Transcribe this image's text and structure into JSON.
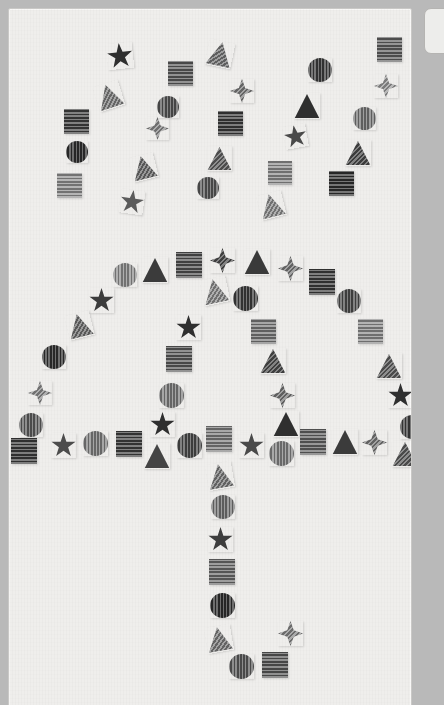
{
  "scene": {
    "title": "Textured shape mosaic forming an umbrella",
    "description": "Grayscale geometric shapes with striped textures arranged to outline an umbrella with falling rain above it",
    "background_color": "#efeeec",
    "panel_border_color": "#c9c8c6",
    "page_background": "#b9b9b9"
  },
  "side_panel": {
    "present": true,
    "background": "#ededeb",
    "border": "#b5b4b2"
  },
  "shape_legend": {
    "types": [
      "star",
      "star4",
      "square",
      "circle",
      "triangle"
    ],
    "textures": [
      "horizontal-stripes",
      "vertical-stripes",
      "diagonal-stripes",
      "solid"
    ],
    "gray_values": [
      "#2f2f2f",
      "#3c3c3c",
      "#4a4a4a",
      "#565656",
      "#646464",
      "#727272",
      "#818181",
      "#909090",
      "#a0a0a0"
    ]
  },
  "groups": {
    "rain": {
      "label": "falling rain shapes",
      "count": 24
    },
    "canopy": {
      "label": "umbrella canopy arc",
      "count": 29
    },
    "rim": {
      "label": "umbrella rim row",
      "count": 18
    },
    "handle": {
      "label": "umbrella handle shaft and hook",
      "count": 13
    }
  },
  "shapes": [
    {
      "g": "rain",
      "t": "st",
      "tex": "tex-n",
      "c": "#2f2f2f",
      "x": 106,
      "y": 42,
      "s": 26,
      "r": -6
    },
    {
      "g": "rain",
      "t": "tr",
      "tex": "tex-d",
      "c": "#7e7e7e",
      "x": 95,
      "y": 82,
      "s": 26,
      "r": -18
    },
    {
      "g": "rain",
      "t": "sq",
      "tex": "tex-h",
      "c": "#3f3f3f",
      "x": 63,
      "y": 108,
      "s": 25,
      "r": 0
    },
    {
      "g": "rain",
      "t": "ci",
      "tex": "tex-v",
      "c": "#2f2f2f",
      "x": 65,
      "y": 140,
      "s": 22,
      "r": 0
    },
    {
      "g": "rain",
      "t": "sq",
      "tex": "tex-h",
      "c": "#8e8e8e",
      "x": 56,
      "y": 172,
      "s": 25,
      "r": 0
    },
    {
      "g": "rain",
      "t": "st",
      "tex": "tex-n",
      "c": "#5b5b5b",
      "x": 119,
      "y": 189,
      "s": 24,
      "r": 8
    },
    {
      "g": "rain",
      "t": "tr",
      "tex": "tex-d",
      "c": "#6d6d6d",
      "x": 130,
      "y": 154,
      "s": 25,
      "r": -14
    },
    {
      "g": "rain",
      "t": "st4",
      "tex": "tex-d",
      "c": "#8a8a8a",
      "x": 145,
      "y": 116,
      "s": 23,
      "r": 0
    },
    {
      "g": "rain",
      "t": "sq",
      "tex": "tex-h",
      "c": "#5a5a5a",
      "x": 167,
      "y": 60,
      "s": 25,
      "r": 0
    },
    {
      "g": "rain",
      "t": "ci",
      "tex": "tex-v",
      "c": "#565656",
      "x": 156,
      "y": 95,
      "s": 22,
      "r": 0
    },
    {
      "g": "rain",
      "t": "tr",
      "tex": "tex-d",
      "c": "#757575",
      "x": 206,
      "y": 40,
      "s": 26,
      "r": 12
    },
    {
      "g": "rain",
      "t": "st4",
      "tex": "tex-d",
      "c": "#7d7d7d",
      "x": 229,
      "y": 78,
      "s": 24,
      "r": 0
    },
    {
      "g": "rain",
      "t": "sq",
      "tex": "tex-h",
      "c": "#3a3a3a",
      "x": 217,
      "y": 110,
      "s": 25,
      "r": 0
    },
    {
      "g": "rain",
      "t": "tr",
      "tex": "tex-d",
      "c": "#5f5f5f",
      "x": 206,
      "y": 145,
      "s": 25,
      "r": 0
    },
    {
      "g": "rain",
      "t": "ci",
      "tex": "tex-v",
      "c": "#585858",
      "x": 196,
      "y": 176,
      "s": 22,
      "r": 0
    },
    {
      "g": "rain",
      "t": "tr",
      "tex": "tex-d",
      "c": "#8d8d8d",
      "x": 258,
      "y": 192,
      "s": 25,
      "r": -14
    },
    {
      "g": "rain",
      "t": "sq",
      "tex": "tex-h",
      "c": "#8b8b8b",
      "x": 267,
      "y": 160,
      "s": 24,
      "r": 0
    },
    {
      "g": "rain",
      "t": "st",
      "tex": "tex-n",
      "c": "#4a4a4a",
      "x": 283,
      "y": 124,
      "s": 23,
      "r": -10
    },
    {
      "g": "rain",
      "t": "tr",
      "tex": "tex-n",
      "c": "#2f2f2f",
      "x": 293,
      "y": 92,
      "s": 26,
      "r": 0
    },
    {
      "g": "rain",
      "t": "ci",
      "tex": "tex-v",
      "c": "#3d3d3d",
      "x": 307,
      "y": 57,
      "s": 24,
      "r": 0
    },
    {
      "g": "rain",
      "t": "sq",
      "tex": "tex-h",
      "c": "#2f2f2f",
      "x": 328,
      "y": 170,
      "s": 25,
      "r": 0
    },
    {
      "g": "rain",
      "t": "tr",
      "tex": "tex-d",
      "c": "#4b4b4b",
      "x": 344,
      "y": 139,
      "s": 26,
      "r": 0
    },
    {
      "g": "rain",
      "t": "ci",
      "tex": "tex-v",
      "c": "#757575",
      "x": 352,
      "y": 106,
      "s": 23,
      "r": 0
    },
    {
      "g": "rain",
      "t": "st4",
      "tex": "tex-d",
      "c": "#9a9a9a",
      "x": 373,
      "y": 73,
      "s": 24,
      "r": 0
    },
    {
      "g": "rain",
      "t": "sq",
      "tex": "tex-h",
      "c": "#5f5f5f",
      "x": 376,
      "y": 36,
      "s": 25,
      "r": 0
    },
    {
      "g": "canopy",
      "t": "tr",
      "tex": "tex-n",
      "c": "#3b3b3b",
      "x": 141,
      "y": 256,
      "s": 26,
      "r": 0
    },
    {
      "g": "canopy",
      "t": "sq",
      "tex": "tex-h",
      "c": "#4f4f4f",
      "x": 175,
      "y": 251,
      "s": 26,
      "r": 0
    },
    {
      "g": "canopy",
      "t": "st4",
      "tex": "tex-d",
      "c": "#4d4d4d",
      "x": 209,
      "y": 247,
      "s": 25,
      "r": 0
    },
    {
      "g": "canopy",
      "t": "tr",
      "tex": "tex-n",
      "c": "#3a3a3a",
      "x": 243,
      "y": 248,
      "s": 26,
      "r": 0
    },
    {
      "g": "canopy",
      "t": "st4",
      "tex": "tex-d",
      "c": "#7b7b7b",
      "x": 277,
      "y": 255,
      "s": 25,
      "r": 0
    },
    {
      "g": "canopy",
      "t": "sq",
      "tex": "tex-h",
      "c": "#3b3b3b",
      "x": 308,
      "y": 268,
      "s": 26,
      "r": 0
    },
    {
      "g": "canopy",
      "t": "ci",
      "tex": "tex-v",
      "c": "#4c4c4c",
      "x": 336,
      "y": 288,
      "s": 24,
      "r": 0
    },
    {
      "g": "canopy",
      "t": "sq",
      "tex": "tex-h",
      "c": "#8a8a8a",
      "x": 357,
      "y": 318,
      "s": 25,
      "r": 0
    },
    {
      "g": "canopy",
      "t": "tr",
      "tex": "tex-d",
      "c": "#5d5d5d",
      "x": 375,
      "y": 352,
      "s": 26,
      "r": 0
    },
    {
      "g": "canopy",
      "t": "st",
      "tex": "tex-n",
      "c": "#2f2f2f",
      "x": 387,
      "y": 382,
      "s": 25,
      "r": 0
    },
    {
      "g": "canopy",
      "t": "ci",
      "tex": "tex-v",
      "c": "#3e3e3e",
      "x": 399,
      "y": 414,
      "s": 24,
      "r": 0
    },
    {
      "g": "canopy",
      "t": "ci",
      "tex": "tex-v",
      "c": "#8d8d8d",
      "x": 112,
      "y": 262,
      "s": 24,
      "r": 0
    },
    {
      "g": "canopy",
      "t": "st",
      "tex": "tex-n",
      "c": "#3c3c3c",
      "x": 88,
      "y": 287,
      "s": 25,
      "r": 0
    },
    {
      "g": "canopy",
      "t": "tr",
      "tex": "tex-d",
      "c": "#6f6f6f",
      "x": 66,
      "y": 312,
      "s": 25,
      "r": -14
    },
    {
      "g": "canopy",
      "t": "ci",
      "tex": "tex-v",
      "c": "#313131",
      "x": 41,
      "y": 344,
      "s": 24,
      "r": 0
    },
    {
      "g": "canopy",
      "t": "st4",
      "tex": "tex-d",
      "c": "#8c8c8c",
      "x": 27,
      "y": 380,
      "s": 24,
      "r": 0
    },
    {
      "g": "canopy",
      "t": "ci",
      "tex": "tex-v",
      "c": "#5e5e5e",
      "x": 18,
      "y": 412,
      "s": 24,
      "r": 0
    },
    {
      "g": "canopy",
      "t": "tr",
      "tex": "tex-d",
      "c": "#8b8b8b",
      "x": 201,
      "y": 277,
      "s": 26,
      "r": -12
    },
    {
      "g": "canopy",
      "t": "ci",
      "tex": "tex-v",
      "c": "#3d3d3d",
      "x": 232,
      "y": 285,
      "s": 25,
      "r": 0
    },
    {
      "g": "canopy",
      "t": "st",
      "tex": "tex-n",
      "c": "#2f2f2f",
      "x": 175,
      "y": 314,
      "s": 25,
      "r": 0
    },
    {
      "g": "canopy",
      "t": "sq",
      "tex": "tex-h",
      "c": "#777777",
      "x": 250,
      "y": 318,
      "s": 25,
      "r": 0
    },
    {
      "g": "canopy",
      "t": "sq",
      "tex": "tex-h",
      "c": "#5a5a5a",
      "x": 165,
      "y": 345,
      "s": 26,
      "r": 0
    },
    {
      "g": "canopy",
      "t": "tr",
      "tex": "tex-d",
      "c": "#4d4d4d",
      "x": 259,
      "y": 347,
      "s": 26,
      "r": 0
    },
    {
      "g": "canopy",
      "t": "ci",
      "tex": "tex-v",
      "c": "#7e7e7e",
      "x": 158,
      "y": 382,
      "s": 25,
      "r": 0
    },
    {
      "g": "canopy",
      "t": "st4",
      "tex": "tex-d",
      "c": "#777777",
      "x": 269,
      "y": 382,
      "s": 25,
      "r": 0
    },
    {
      "g": "canopy",
      "t": "st",
      "tex": "tex-n",
      "c": "#2f2f2f",
      "x": 149,
      "y": 411,
      "s": 25,
      "r": 0
    },
    {
      "g": "canopy",
      "t": "tr",
      "tex": "tex-n",
      "c": "#2f2f2f",
      "x": 272,
      "y": 410,
      "s": 26,
      "r": 0
    },
    {
      "g": "rim",
      "t": "sq",
      "tex": "tex-h",
      "c": "#3a3a3a",
      "x": 10,
      "y": 437,
      "s": 26,
      "r": 0
    },
    {
      "g": "rim",
      "t": "st",
      "tex": "tex-n",
      "c": "#4c4c4c",
      "x": 50,
      "y": 432,
      "s": 25,
      "r": 0
    },
    {
      "g": "rim",
      "t": "ci",
      "tex": "tex-v",
      "c": "#7f7f7f",
      "x": 82,
      "y": 430,
      "s": 25,
      "r": 0
    },
    {
      "g": "rim",
      "t": "sq",
      "tex": "tex-h",
      "c": "#3f3f3f",
      "x": 115,
      "y": 430,
      "s": 26,
      "r": 0
    },
    {
      "g": "rim",
      "t": "tr",
      "tex": "tex-n",
      "c": "#444444",
      "x": 143,
      "y": 442,
      "s": 26,
      "r": 0
    },
    {
      "g": "rim",
      "t": "ci",
      "tex": "tex-v",
      "c": "#4b4b4b",
      "x": 176,
      "y": 432,
      "s": 25,
      "r": 0
    },
    {
      "g": "rim",
      "t": "sq",
      "tex": "tex-h",
      "c": "#7c7c7c",
      "x": 205,
      "y": 425,
      "s": 26,
      "r": 0
    },
    {
      "g": "rim",
      "t": "st",
      "tex": "tex-n",
      "c": "#4a4a4a",
      "x": 238,
      "y": 432,
      "s": 25,
      "r": 0
    },
    {
      "g": "rim",
      "t": "ci",
      "tex": "tex-v",
      "c": "#838383",
      "x": 268,
      "y": 440,
      "s": 25,
      "r": 0
    },
    {
      "g": "rim",
      "t": "sq",
      "tex": "tex-h",
      "c": "#626262",
      "x": 299,
      "y": 428,
      "s": 26,
      "r": 0
    },
    {
      "g": "rim",
      "t": "tr",
      "tex": "tex-n",
      "c": "#3b3b3b",
      "x": 331,
      "y": 428,
      "s": 26,
      "r": 0
    },
    {
      "g": "rim",
      "t": "st4",
      "tex": "tex-d",
      "c": "#7a7a7a",
      "x": 361,
      "y": 429,
      "s": 25,
      "r": 0
    },
    {
      "g": "rim",
      "t": "tr",
      "tex": "tex-d",
      "c": "#5c5c5c",
      "x": 391,
      "y": 440,
      "s": 26,
      "r": 0
    },
    {
      "g": "handle",
      "t": "tr",
      "tex": "tex-d",
      "c": "#7a7a7a",
      "x": 206,
      "y": 462,
      "s": 26,
      "r": -10
    },
    {
      "g": "handle",
      "t": "ci",
      "tex": "tex-v",
      "c": "#737373",
      "x": 210,
      "y": 494,
      "s": 24,
      "r": 0
    },
    {
      "g": "handle",
      "t": "st",
      "tex": "tex-n",
      "c": "#3d3d3d",
      "x": 207,
      "y": 526,
      "s": 25,
      "r": 0
    },
    {
      "g": "handle",
      "t": "sq",
      "tex": "tex-h",
      "c": "#6a6a6a",
      "x": 208,
      "y": 558,
      "s": 26,
      "r": 0
    },
    {
      "g": "handle",
      "t": "ci",
      "tex": "tex-v",
      "c": "#2f2f2f",
      "x": 209,
      "y": 592,
      "s": 25,
      "r": 0
    },
    {
      "g": "handle",
      "t": "tr",
      "tex": "tex-d",
      "c": "#7c7c7c",
      "x": 205,
      "y": 625,
      "s": 26,
      "r": -10
    },
    {
      "g": "handle",
      "t": "ci",
      "tex": "tex-v",
      "c": "#5b5b5b",
      "x": 228,
      "y": 653,
      "s": 25,
      "r": 0
    },
    {
      "g": "handle",
      "t": "sq",
      "tex": "tex-h",
      "c": "#575757",
      "x": 261,
      "y": 651,
      "s": 26,
      "r": 0
    },
    {
      "g": "handle",
      "t": "st4",
      "tex": "tex-d",
      "c": "#868686",
      "x": 277,
      "y": 620,
      "s": 25,
      "r": 0
    }
  ]
}
